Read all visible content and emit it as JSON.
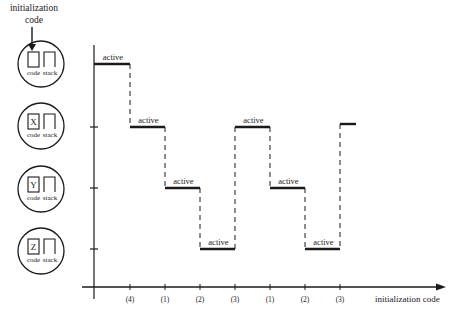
{
  "annotation": {
    "line1": "initialization",
    "line2": "code"
  },
  "processes": [
    {
      "id": "init",
      "code_label": "code",
      "stack_label": "stack",
      "content": "",
      "cy": 64
    },
    {
      "id": "X",
      "code_label": "code",
      "stack_label": "stack",
      "content": "X",
      "cy": 126
    },
    {
      "id": "Y",
      "code_label": "code",
      "stack_label": "stack",
      "content": "Y",
      "cy": 189
    },
    {
      "id": "Z",
      "code_label": "code",
      "stack_label": "stack",
      "content": "Z",
      "cy": 251
    }
  ],
  "chart": {
    "x_axis_label": "initialization code",
    "x_ticks": [
      "(4)",
      "(1)",
      "(2)",
      "(3)",
      "(1)",
      "(2)",
      "(3)"
    ],
    "segment_label": "active",
    "segments": [
      {
        "level": 0,
        "label": "active"
      },
      {
        "level": 1,
        "label": "active"
      },
      {
        "level": 2,
        "label": "active"
      },
      {
        "level": 3,
        "label": "active"
      },
      {
        "level": 1,
        "label": "active"
      },
      {
        "level": 2,
        "label": "active"
      },
      {
        "level": 3,
        "label": "active"
      },
      {
        "level": 1,
        "label": ""
      }
    ]
  }
}
